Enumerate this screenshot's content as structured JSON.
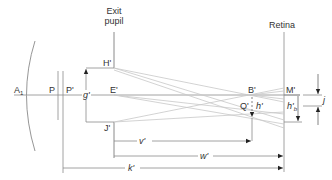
{
  "diagram": {
    "type": "optical ray diagram",
    "headings": {
      "exit_pupil_line1": "Exit",
      "exit_pupil_line2": "pupil",
      "retina": "Retina"
    },
    "points": {
      "A1": "A",
      "A1_sub": "1",
      "P": "P",
      "P_prime": "P'",
      "E_prime": "E'",
      "H_prime": "H'",
      "J_prime": "J'",
      "B_prime": "B'",
      "M_prime": "M'",
      "Q_prime": "Q'"
    },
    "dimensions": {
      "g_prime": "g'",
      "h_prime": "h'",
      "h_b_prime": "h'",
      "h_b_sub": "b",
      "j": "j",
      "v_prime": "v'",
      "w_prime": "w'",
      "k_prime": "k'"
    },
    "colors": {
      "line": "#8a8a8a",
      "ray": "#c8c8c8",
      "text": "#333333",
      "arrow": "#222222"
    }
  }
}
